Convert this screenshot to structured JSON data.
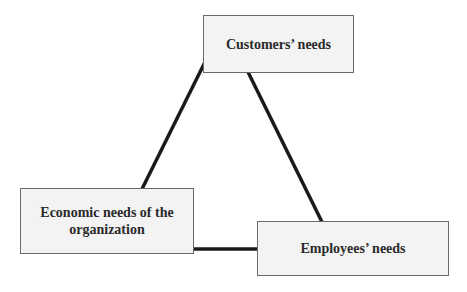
{
  "diagram": {
    "type": "triangle-relationship",
    "nodes": [
      {
        "id": "customers",
        "label": "Customers’ needs"
      },
      {
        "id": "economic",
        "label": "Economic needs of the organization"
      },
      {
        "id": "employees",
        "label": "Employees’ needs"
      }
    ],
    "edges": [
      {
        "from": "customers",
        "to": "economic"
      },
      {
        "from": "customers",
        "to": "employees"
      },
      {
        "from": "economic",
        "to": "employees"
      }
    ],
    "colors": {
      "line": "#1a1a1a",
      "box_border": "#6a6a6a",
      "box_fill": "#f3f3f3",
      "text": "#2a2a2a"
    }
  }
}
